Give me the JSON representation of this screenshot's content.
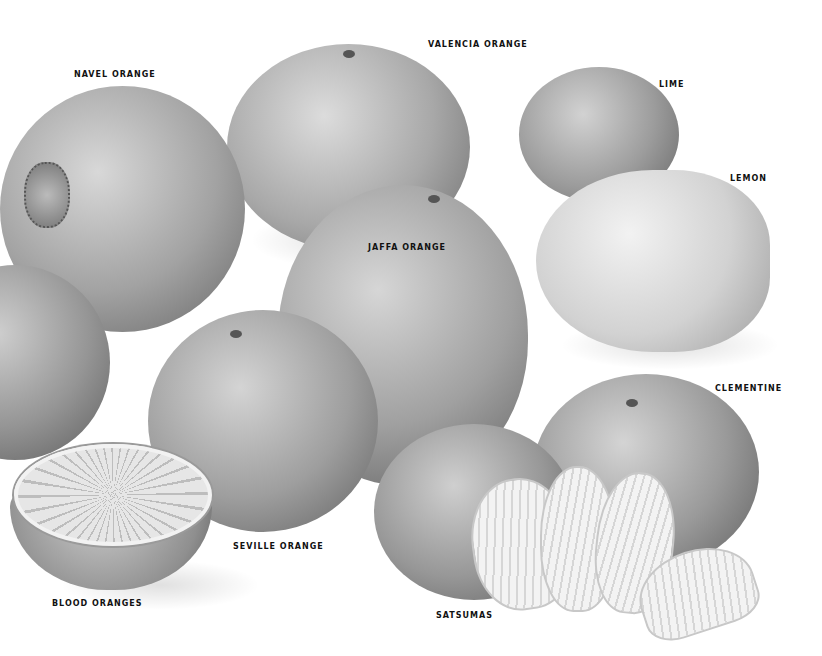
{
  "illustration": {
    "description": "Pencil illustration of citrus fruits in grayscale",
    "background": "#ffffff",
    "labels": {
      "navel_orange": "NAVEL ORANGE",
      "valencia_orange": "VALENCIA ORANGE",
      "lime": "LIME",
      "lemon": "LEMON",
      "jaffa_orange": "JAFFA ORANGE",
      "clementine": "CLEMENTINE",
      "seville_orange": "SEVILLE ORANGE",
      "blood_oranges": "BLOOD ORANGES",
      "satsumas": "SATSUMAS"
    }
  }
}
